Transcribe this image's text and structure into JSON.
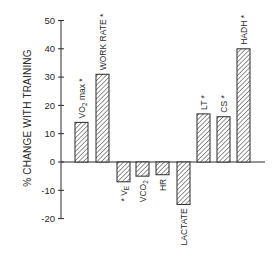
{
  "chart_data": {
    "type": "bar",
    "title": "",
    "xlabel": "",
    "ylabel": "% CHANGE WITH TRAINING",
    "ylim": [
      -20,
      50
    ],
    "yticks": [
      50,
      40,
      30,
      20,
      10,
      0,
      -10,
      -20
    ],
    "grid": false,
    "legend": null,
    "categories": [
      "VO2 max",
      "WORK RATE",
      "VE",
      "VCO2",
      "HR",
      "LACTATE",
      "LT",
      "CS",
      "HADH"
    ],
    "values": [
      14,
      31,
      -7,
      -5,
      -4.5,
      -15,
      17,
      16,
      40
    ],
    "significant": [
      true,
      true,
      true,
      false,
      false,
      false,
      true,
      true,
      true
    ],
    "annotations": "* denotes significant change"
  },
  "labels": [
    {
      "main": "VO",
      "sub": "2",
      "tail": " max",
      "star": " *",
      "prefix": ""
    },
    {
      "main": "WORK RATE",
      "sub": "",
      "tail": "",
      "star": " *",
      "prefix": ""
    },
    {
      "main": "V",
      "sub": "E",
      "tail": "",
      "star": "",
      "prefix": "* "
    },
    {
      "main": "VCO",
      "sub": "2",
      "tail": "",
      "star": "",
      "prefix": ""
    },
    {
      "main": "HR",
      "sub": "",
      "tail": "",
      "star": "",
      "prefix": ""
    },
    {
      "main": "LACTATE",
      "sub": "",
      "tail": "",
      "star": "",
      "prefix": ""
    },
    {
      "main": "LT",
      "sub": "",
      "tail": "",
      "star": " *",
      "prefix": ""
    },
    {
      "main": "CS",
      "sub": "",
      "tail": "",
      "star": " *",
      "prefix": ""
    },
    {
      "main": "HADH",
      "sub": "",
      "tail": "",
      "star": " *",
      "prefix": ""
    }
  ],
  "colors": {
    "ink": "#2a2a2a",
    "bar_fill": "#ffffff",
    "hatch": "#2a2a2a"
  }
}
